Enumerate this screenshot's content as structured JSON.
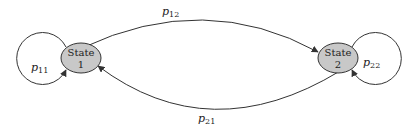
{
  "diagram": {
    "type": "markov-chain-state-diagram",
    "states": [
      {
        "id": "state-1",
        "line1": "State",
        "line2": "1",
        "fill": "#c8c8c8"
      },
      {
        "id": "state-2",
        "line1": "State",
        "line2": "2",
        "fill": "#c8c8c8"
      }
    ],
    "transitions": [
      {
        "from": "state-1",
        "to": "state-1",
        "label_main": "p",
        "label_sub": "11"
      },
      {
        "from": "state-1",
        "to": "state-2",
        "label_main": "p",
        "label_sub": "12"
      },
      {
        "from": "state-2",
        "to": "state-1",
        "label_main": "p",
        "label_sub": "21"
      },
      {
        "from": "state-2",
        "to": "state-2",
        "label_main": "p",
        "label_sub": "22"
      }
    ],
    "colors": {
      "stroke": "#333333",
      "state_fill": "#c8c8c8",
      "background": "#ffffff"
    }
  }
}
